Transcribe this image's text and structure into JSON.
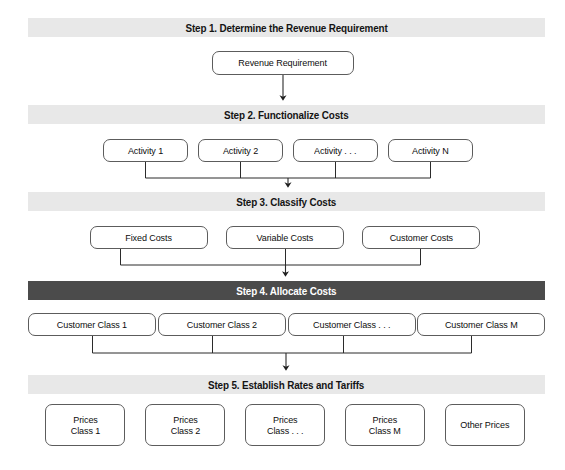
{
  "diagram": {
    "background_color": "#ffffff",
    "banner_color": "#e8e8e8",
    "banner_dark_color": "#4b4b4b",
    "node_border_color": "#5c5c5c",
    "connector_color": "#2b2b2b",
    "steps": [
      {
        "id": "step-1",
        "label": "Step 1. Determine the Revenue Requirement",
        "style": "light",
        "nodes": [
          {
            "id": "revenue-requirement",
            "label": "Revenue Requirement"
          }
        ]
      },
      {
        "id": "step-2",
        "label": "Step 2. Functionalize Costs",
        "style": "light",
        "nodes": [
          {
            "id": "activity-1",
            "label": "Activity 1"
          },
          {
            "id": "activity-2",
            "label": "Activity 2"
          },
          {
            "id": "activity-ellipsis",
            "label": "Activity . . ."
          },
          {
            "id": "activity-n",
            "label": "Activity N"
          }
        ]
      },
      {
        "id": "step-3",
        "label": "Step 3. Classify Costs",
        "style": "light",
        "nodes": [
          {
            "id": "fixed-costs",
            "label": "Fixed Costs"
          },
          {
            "id": "variable-costs",
            "label": "Variable Costs"
          },
          {
            "id": "customer-costs",
            "label": "Customer Costs"
          }
        ]
      },
      {
        "id": "step-4",
        "label": "Step 4. Allocate Costs",
        "style": "dark",
        "nodes": [
          {
            "id": "customer-class-1",
            "label": "Customer Class 1"
          },
          {
            "id": "customer-class-2",
            "label": "Customer Class 2"
          },
          {
            "id": "customer-class-ellipsis",
            "label": "Customer Class . . ."
          },
          {
            "id": "customer-class-m",
            "label": "Customer Class M"
          }
        ]
      },
      {
        "id": "step-5",
        "label": "Step 5. Establish Rates and Tariffs",
        "style": "light",
        "nodes": [
          {
            "id": "prices-class-1",
            "label": "Prices\nClass 1"
          },
          {
            "id": "prices-class-2",
            "label": "Prices\nClass 2"
          },
          {
            "id": "prices-class-ellipsis",
            "label": "Prices\nClass . . ."
          },
          {
            "id": "prices-class-m",
            "label": "Prices\nClass M"
          },
          {
            "id": "other-prices",
            "label": "Other Prices"
          }
        ]
      }
    ],
    "connectors": [
      {
        "id": "connector-step1-to-step2",
        "kind": "single-arrow"
      },
      {
        "id": "connector-step2-to-step3",
        "kind": "bus-arrow"
      },
      {
        "id": "connector-step3-to-step4",
        "kind": "bus-arrow"
      },
      {
        "id": "connector-step4-to-step5",
        "kind": "bus-arrow"
      }
    ]
  }
}
